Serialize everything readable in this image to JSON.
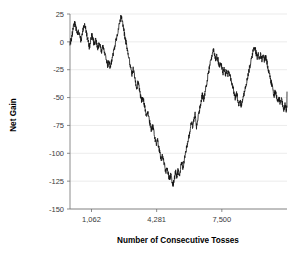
{
  "chart_data": {
    "type": "line",
    "title": "",
    "subtitle": "",
    "xlabel": "Number of Consecutive Tosses",
    "ylabel": "Net Gain",
    "xlim": [
      0,
      10719
    ],
    "ylim": [
      -150,
      25
    ],
    "grid": true,
    "grid_axis": "y",
    "legend": false,
    "legend_position": "none",
    "series_name": "Net Gain",
    "series_color": "#111111",
    "y_ticks": [
      25,
      0,
      -25,
      -50,
      -75,
      -100,
      -125,
      -150
    ],
    "y_tick_labels": [
      "25",
      "0",
      "-25",
      "-50",
      "-75",
      "-100",
      "-125",
      "-150"
    ],
    "x_ticks": [
      1062,
      4281,
      7500
    ],
    "x_tick_labels": [
      "1,062",
      "4,281",
      "7,500"
    ],
    "x": [
      0,
      60,
      120,
      180,
      240,
      300,
      360,
      420,
      480,
      540,
      600,
      660,
      720,
      780,
      840,
      900,
      960,
      1020,
      1080,
      1140,
      1200,
      1260,
      1320,
      1380,
      1440,
      1500,
      1560,
      1620,
      1680,
      1740,
      1800,
      1860,
      1920,
      1980,
      2040,
      2100,
      2160,
      2220,
      2280,
      2340,
      2400,
      2460,
      2520,
      2580,
      2640,
      2700,
      2760,
      2820,
      2880,
      2940,
      3000,
      3060,
      3120,
      3180,
      3240,
      3300,
      3360,
      3420,
      3480,
      3540,
      3600,
      3660,
      3720,
      3780,
      3840,
      3900,
      3960,
      4020,
      4080,
      4140,
      4200,
      4260,
      4320,
      4380,
      4440,
      4500,
      4560,
      4620,
      4680,
      4740,
      4800,
      4860,
      4920,
      4980,
      5040,
      5100,
      5160,
      5220,
      5280,
      5340,
      5400,
      5460,
      5520,
      5580,
      5640,
      5700,
      5760,
      5820,
      5880,
      5940,
      6000,
      6060,
      6120,
      6180,
      6240,
      6300,
      6360,
      6420,
      6480,
      6540,
      6600,
      6660,
      6720,
      6780,
      6840,
      6900,
      6960,
      7020,
      7080,
      7140,
      7200,
      7260,
      7320,
      7380,
      7440,
      7500,
      7560,
      7620,
      7680,
      7740,
      7800,
      7860,
      7920,
      7980,
      8040,
      8100,
      8160,
      8220,
      8280,
      8340,
      8400,
      8460,
      8520,
      8580,
      8640,
      8700,
      8760,
      8820,
      8880,
      8940,
      9000,
      9060,
      9120,
      9180,
      9240,
      9300,
      9360,
      9420,
      9480,
      9540,
      9600,
      9660,
      9720,
      9780,
      9840,
      9900,
      9960,
      10020,
      10080,
      10140,
      10200,
      10260,
      10320,
      10380,
      10440,
      10500,
      10560,
      10620,
      10680,
      10719
    ],
    "y": [
      -2,
      2,
      8,
      14,
      17,
      12,
      6,
      10,
      5,
      1,
      6,
      12,
      16,
      11,
      5,
      0,
      -5,
      1,
      6,
      2,
      -3,
      2,
      -2,
      -6,
      -2,
      -5,
      -9,
      -4,
      -8,
      -12,
      -17,
      -21,
      -18,
      -22,
      -19,
      -14,
      -9,
      -4,
      2,
      7,
      13,
      18,
      23,
      18,
      12,
      6,
      0,
      -6,
      -12,
      -18,
      -24,
      -29,
      -24,
      -30,
      -36,
      -41,
      -36,
      -42,
      -48,
      -53,
      -49,
      -55,
      -61,
      -66,
      -62,
      -68,
      -74,
      -79,
      -75,
      -81,
      -87,
      -92,
      -88,
      -94,
      -100,
      -105,
      -101,
      -107,
      -112,
      -117,
      -113,
      -119,
      -124,
      -119,
      -125,
      -128,
      -122,
      -116,
      -121,
      -115,
      -120,
      -114,
      -108,
      -113,
      -107,
      -101,
      -95,
      -89,
      -84,
      -78,
      -72,
      -76,
      -70,
      -64,
      -77,
      -71,
      -65,
      -59,
      -53,
      -47,
      -52,
      -46,
      -40,
      -34,
      -28,
      -22,
      -17,
      -11,
      -6,
      -11,
      -16,
      -12,
      -17,
      -22,
      -18,
      -23,
      -28,
      -24,
      -29,
      -25,
      -30,
      -26,
      -31,
      -36,
      -40,
      -45,
      -50,
      -46,
      -51,
      -56,
      -52,
      -57,
      -53,
      -48,
      -43,
      -38,
      -33,
      -28,
      -22,
      -17,
      -12,
      -7,
      -5,
      -9,
      -14,
      -10,
      -15,
      -11,
      -16,
      -12,
      -17,
      -13,
      -18,
      -23,
      -28,
      -33,
      -38,
      -43,
      -48,
      -44,
      -49,
      -54,
      -50,
      -55,
      -51,
      -56,
      -61,
      -57,
      -62,
      -58,
      -63,
      -59,
      -54,
      -49,
      -55,
      -50,
      -45
    ]
  },
  "axes": {
    "y_title": "Net Gain",
    "x_title": "Number of Consecutive Tosses"
  }
}
